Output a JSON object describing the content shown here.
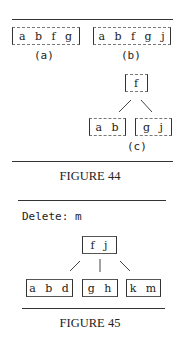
{
  "figure44": {
    "a": {
      "keys": "a b f g",
      "label": "(a)"
    },
    "b": {
      "keys": "a b f g j",
      "label": "(b)"
    },
    "c": {
      "root": "f",
      "left": "a b",
      "right": "g j",
      "label": "(c)"
    },
    "caption": "FIGURE 44"
  },
  "figure45": {
    "operation": "Delete: m",
    "root": "f j",
    "children": [
      "a b d",
      "g h",
      "k m"
    ],
    "caption": "FIGURE 45"
  }
}
